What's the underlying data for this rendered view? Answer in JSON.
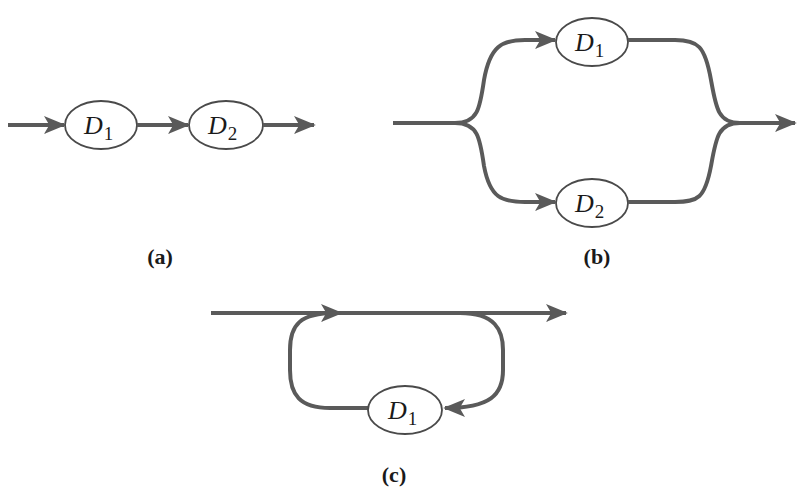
{
  "diagram": {
    "stroke_color": "#5a5a5a",
    "panels": [
      {
        "id": "a",
        "caption": "(a)",
        "configuration": "series",
        "nodes": [
          {
            "symbol": "D",
            "subscript": "1"
          },
          {
            "symbol": "D",
            "subscript": "2"
          }
        ]
      },
      {
        "id": "b",
        "caption": "(b)",
        "configuration": "parallel",
        "nodes": [
          {
            "symbol": "D",
            "subscript": "1"
          },
          {
            "symbol": "D",
            "subscript": "2"
          }
        ]
      },
      {
        "id": "c",
        "caption": "(c)",
        "configuration": "feedback-loop",
        "nodes": [
          {
            "symbol": "D",
            "subscript": "1"
          }
        ]
      }
    ]
  }
}
